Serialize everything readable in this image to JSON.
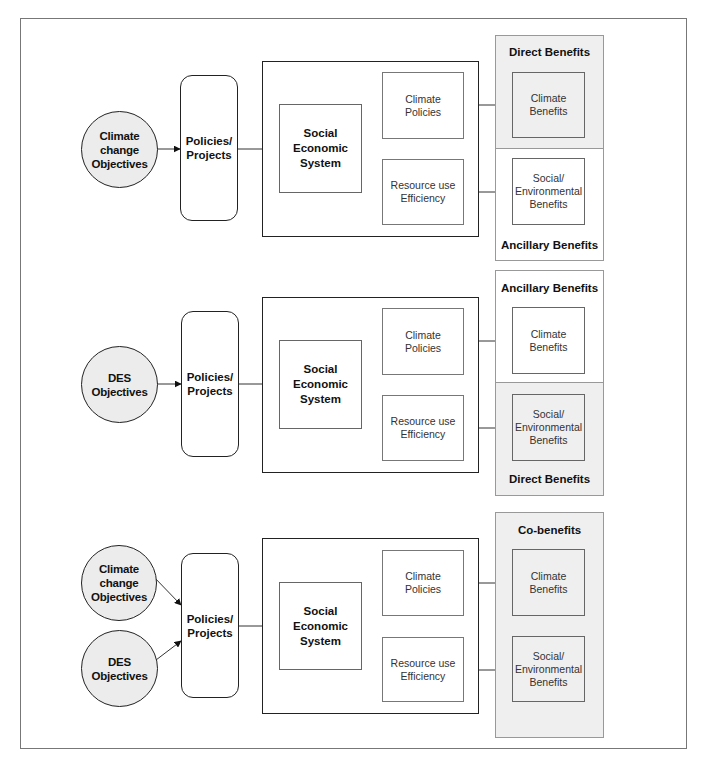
{
  "diagram": {
    "panels": [
      {
        "id": "panel-1",
        "objectives": [
          "Climate\nchange\nObjectives"
        ],
        "policies_label": "Policies/\nProjects",
        "system_label": "Social\nEconomic\nSystem",
        "climate_policies_label": "Climate\nPolicies",
        "resource_efficiency_label": "Resource use\nEfficiency",
        "benefits_top_title": "Direct Benefits",
        "benefits_bottom_title": "Ancillary Benefits",
        "climate_benefits_label": "Climate\nBenefits",
        "social_benefits_label": "Social/\nEnvironmental\nBenefits"
      },
      {
        "id": "panel-2",
        "objectives": [
          "DES\nObjectives"
        ],
        "policies_label": "Policies/\nProjects",
        "system_label": "Social\nEconomic\nSystem",
        "climate_policies_label": "Climate\nPolicies",
        "resource_efficiency_label": "Resource use\nEfficiency",
        "benefits_top_title": "Ancillary Benefits",
        "benefits_bottom_title": "Direct Benefits",
        "climate_benefits_label": "Climate\nBenefits",
        "social_benefits_label": "Social/\nEnvironmental\nBenefits"
      },
      {
        "id": "panel-3",
        "objectives": [
          "Climate\nchange\nObjectives",
          "DES\nObjectives"
        ],
        "policies_label": "Policies/\nProjects",
        "system_label": "Social\nEconomic\nSystem",
        "climate_policies_label": "Climate\nPolicies",
        "resource_efficiency_label": "Resource use\nEfficiency",
        "benefits_title": "Co-benefits",
        "climate_benefits_label": "Climate\nBenefits",
        "social_benefits_label": "Social/\nEnvironmental\nBenefits"
      }
    ]
  },
  "colors": {
    "shaded_fill": "#efefef",
    "circle_fill": "#ececec",
    "stroke": "#222222"
  }
}
